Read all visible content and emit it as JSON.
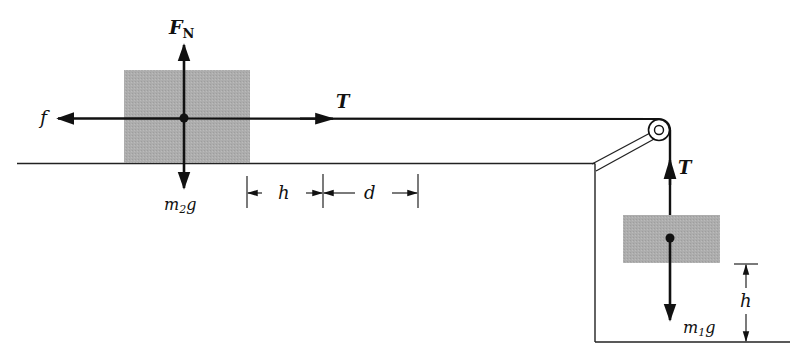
{
  "diagram": {
    "type": "free-body diagram",
    "colors": {
      "ink": "#111111",
      "block_fill": "#ababab",
      "background": "#ffffff"
    },
    "labels": {
      "normal_force": "F",
      "normal_force_sub": "N",
      "friction": "f",
      "tension_horizontal": "T",
      "tension_vertical": "T",
      "weight_block2": "m",
      "weight_block2_sub": "2",
      "weight_block2_g": "g",
      "weight_block1": "m",
      "weight_block1_sub": "1",
      "weight_block1_g": "g",
      "dim_h_horizontal": "h",
      "dim_d": "d",
      "dim_h_vertical": "h"
    },
    "objects": {
      "block_on_table": "m2",
      "hanging_block": "m1",
      "pulley": "pulley",
      "table": "table",
      "floor": "floor"
    }
  }
}
